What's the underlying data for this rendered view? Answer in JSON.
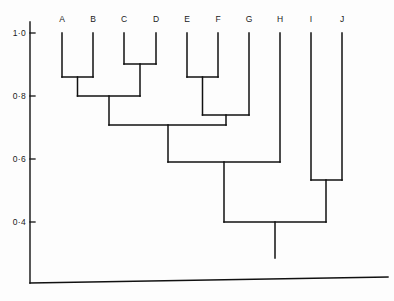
{
  "chart_data": {
    "type": "dendrogram",
    "title": "",
    "xlabel": "",
    "ylabel": "",
    "ylim": [
      0.4,
      1.0
    ],
    "grid": false,
    "legend": null,
    "y_axis": {
      "tick_labels": [
        "1·0",
        "0·8",
        "0·6",
        "0·4"
      ],
      "tick_values": [
        1.0,
        0.8,
        0.6,
        0.4
      ],
      "tick_pixel_y": [
        33,
        96,
        159,
        222
      ]
    },
    "leaves": [
      {
        "label": "A",
        "x": 62
      },
      {
        "label": "B",
        "x": 93
      },
      {
        "label": "C",
        "x": 124
      },
      {
        "label": "D",
        "x": 156
      },
      {
        "label": "E",
        "x": 187
      },
      {
        "label": "F",
        "x": 218
      },
      {
        "label": "G",
        "x": 249
      },
      {
        "label": "H",
        "x": 280
      },
      {
        "label": "I",
        "x": 311
      },
      {
        "label": "J",
        "x": 342
      }
    ],
    "leaf_top_value": 1.0,
    "merges": [
      {
        "name": "A-B",
        "members": [
          "A",
          "B"
        ],
        "height": 0.855,
        "pixel_y": 77,
        "left_x": 62,
        "right_x": 93,
        "center_x": 77.5
      },
      {
        "name": "C-D",
        "members": [
          "C",
          "D"
        ],
        "height": 0.897,
        "pixel_y": 64,
        "left_x": 124,
        "right_x": 156,
        "center_x": 140
      },
      {
        "name": "E-F",
        "members": [
          "E",
          "F"
        ],
        "height": 0.855,
        "pixel_y": 77,
        "left_x": 187,
        "right_x": 218,
        "center_x": 202.5
      },
      {
        "name": "ABCD",
        "members": [
          "A-B",
          "C-D"
        ],
        "height": 0.8,
        "pixel_y": 96,
        "left_x": 77.5,
        "right_x": 140,
        "center_x": 109
      },
      {
        "name": "EFG",
        "members": [
          "E-F",
          "G"
        ],
        "height": 0.721,
        "pixel_y": 115,
        "left_x": 202.5,
        "right_x": 249,
        "center_x": 226
      },
      {
        "name": "ABCDEFG",
        "members": [
          "ABCD",
          "EFG"
        ],
        "height": 0.69,
        "pixel_y": 125,
        "left_x": 109,
        "right_x": 226,
        "center_x": 168
      },
      {
        "name": "I-J",
        "members": [
          "I",
          "J"
        ],
        "height": 0.546,
        "pixel_y": 180,
        "left_x": 311,
        "right_x": 342,
        "center_x": 326
      },
      {
        "name": "ABCDEFGH",
        "members": [
          "ABCDEFG",
          "H"
        ],
        "height": 0.6,
        "pixel_y": 162,
        "left_x": 168,
        "right_x": 280,
        "center_x": 224
      },
      {
        "name": "ROOT",
        "members": [
          "ABCDEFGH",
          "I-J"
        ],
        "height": 0.4,
        "pixel_y": 222,
        "left_x": 224,
        "right_x": 326,
        "center_x": 275
      }
    ],
    "root_stem": {
      "x": 275,
      "from_pixel_y": 222,
      "to_pixel_y": 258
    },
    "axis": {
      "y_axis_x": 30,
      "y_axis_top_y": 22,
      "y_axis_bottom_y": 283,
      "baseline_left_x": 30,
      "baseline_left_y": 283,
      "baseline_right_x": 388,
      "baseline_right_y": 277,
      "tick_length": 5,
      "line_color": "#111111"
    }
  },
  "figure": {
    "background": "#fdfdfd",
    "stroke_color": "#111111",
    "leaf_label_y": 22
  }
}
